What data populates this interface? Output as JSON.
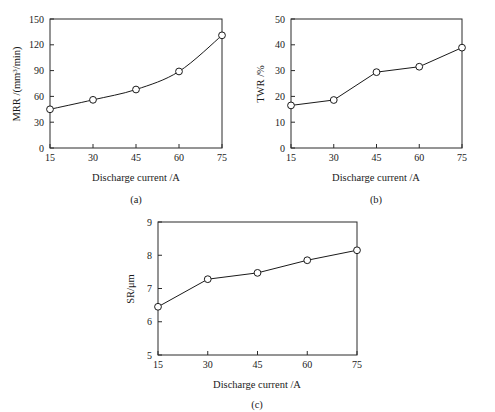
{
  "figure": {
    "background": "#ffffff",
    "line_color": "#1a1a1a",
    "marker_fill": "#ffffff"
  },
  "subplots": [
    {
      "id": "a",
      "caption": "(a)",
      "xlabel": "Discharge current /A",
      "ylabel_main": "MRR /(mm",
      "ylabel_sup": "3",
      "ylabel_tail": "/min)",
      "xticks": [
        "15",
        "30",
        "45",
        "60",
        "75"
      ],
      "yticks": [
        "0",
        "30",
        "60",
        "90",
        "120",
        "150"
      ]
    },
    {
      "id": "b",
      "caption": "(b)",
      "xlabel": "Discharge current /A",
      "ylabel_main": "TWR /%",
      "ylabel_sup": "",
      "ylabel_tail": "",
      "xticks": [
        "15",
        "30",
        "45",
        "60",
        "75"
      ],
      "yticks": [
        "0",
        "10",
        "20",
        "30",
        "40",
        "50"
      ]
    },
    {
      "id": "c",
      "caption": "(c)",
      "xlabel": "Discharge current /A",
      "ylabel_main": "SR/μm",
      "ylabel_sup": "",
      "ylabel_tail": "",
      "xticks": [
        "15",
        "30",
        "45",
        "60",
        "75"
      ],
      "yticks": [
        "5",
        "6",
        "7",
        "8",
        "9"
      ]
    }
  ],
  "chart_data": [
    {
      "type": "line",
      "panel": "a",
      "title": "",
      "xlabel": "Discharge current /A",
      "ylabel": "MRR /(mm3/min)",
      "x": [
        15,
        30,
        45,
        60,
        75
      ],
      "values": [
        45,
        56,
        68,
        89,
        131
      ],
      "xlim": [
        15,
        75
      ],
      "ylim": [
        0,
        150
      ],
      "xticks": [
        15,
        30,
        45,
        60,
        75
      ],
      "yticks": [
        0,
        30,
        60,
        90,
        120,
        150
      ],
      "marker": "open-circle",
      "grid": false,
      "legend": null
    },
    {
      "type": "line",
      "panel": "b",
      "title": "",
      "xlabel": "Discharge current /A",
      "ylabel": "TWR /%",
      "x": [
        15,
        30,
        45,
        60,
        75
      ],
      "values": [
        16.5,
        18.6,
        29.4,
        31.5,
        38.9
      ],
      "xlim": [
        15,
        75
      ],
      "ylim": [
        0,
        50
      ],
      "xticks": [
        15,
        30,
        45,
        60,
        75
      ],
      "yticks": [
        0,
        10,
        20,
        30,
        40,
        50
      ],
      "marker": "open-circle",
      "grid": false,
      "legend": null
    },
    {
      "type": "line",
      "panel": "c",
      "title": "",
      "xlabel": "Discharge current /A",
      "ylabel": "SR/μm",
      "x": [
        15,
        30,
        45,
        60,
        75
      ],
      "values": [
        6.45,
        7.28,
        7.47,
        7.85,
        8.15
      ],
      "xlim": [
        15,
        75
      ],
      "ylim": [
        5,
        9
      ],
      "xticks": [
        15,
        30,
        45,
        60,
        75
      ],
      "yticks": [
        5,
        6,
        7,
        8,
        9
      ],
      "marker": "open-circle",
      "grid": false,
      "legend": null
    }
  ]
}
